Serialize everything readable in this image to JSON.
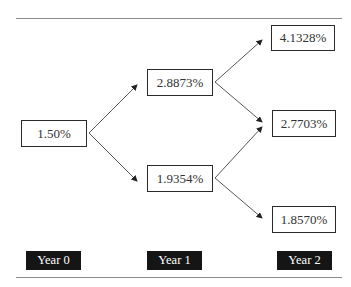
{
  "tree": {
    "year0": {
      "label": "Year 0",
      "nodes": [
        "1.50%"
      ]
    },
    "year1": {
      "label": "Year 1",
      "nodes": [
        "2.8873%",
        "1.9354%"
      ]
    },
    "year2": {
      "label": "Year 2",
      "nodes": [
        "4.1328%",
        "2.7703%",
        "1.8570%"
      ]
    }
  },
  "edges": [
    {
      "from": "1.50%",
      "to": "2.8873%"
    },
    {
      "from": "1.50%",
      "to": "1.9354%"
    },
    {
      "from": "2.8873%",
      "to": "4.1328%"
    },
    {
      "from": "2.8873%",
      "to": "2.7703%"
    },
    {
      "from": "1.9354%",
      "to": "2.7703%"
    },
    {
      "from": "1.9354%",
      "to": "1.8570%"
    }
  ],
  "colors": {
    "label_bg": "#151515",
    "label_text": "#ffffff",
    "box_border": "#2a2a2a",
    "rule": "#8a8a8a"
  }
}
